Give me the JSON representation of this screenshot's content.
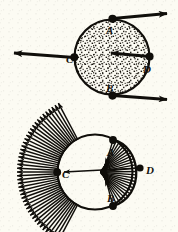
{
  "figure": {
    "background_color": "#fcfbf3",
    "ink_color": "#100e0a",
    "width": 178,
    "height": 232
  },
  "panels": [
    {
      "id": "top",
      "name": "stippled-disk-with-velocity-vectors",
      "shape": "filled-stippled-circle",
      "circle": {
        "cx": 112,
        "cy": 57,
        "r": 38
      },
      "points": [
        {
          "label": "A",
          "x": 112,
          "y": 19,
          "label_x": 109,
          "label_y": 33,
          "marker": "filled-dot"
        },
        {
          "label": "C",
          "x": 74,
          "y": 57,
          "label_x": 69,
          "label_y": 62,
          "marker": "filled-dot"
        },
        {
          "label": "D",
          "x": 150,
          "y": 57,
          "label_x": 145,
          "label_y": 72,
          "marker": "filled-dot"
        },
        {
          "label": "B",
          "x": 112,
          "y": 95,
          "label_x": 109,
          "label_y": 91,
          "marker": "filled-dot"
        }
      ],
      "vectors": [
        {
          "from": "A",
          "x1": 112,
          "y1": 19,
          "x2": 176,
          "y2": 13,
          "direction": "right",
          "name": "velocity-vector-a"
        },
        {
          "from": "C",
          "x1": 74,
          "y1": 57,
          "x2": 4,
          "y2": 52,
          "direction": "left",
          "name": "velocity-vector-c"
        },
        {
          "from": "D",
          "x1": 150,
          "y1": 57,
          "x2": 101,
          "y2": 53,
          "direction": "left",
          "name": "velocity-vector-d"
        },
        {
          "from": "B",
          "x1": 112,
          "y1": 95,
          "x2": 176,
          "y2": 99,
          "direction": "right",
          "name": "velocity-vector-b"
        }
      ]
    },
    {
      "id": "bottom",
      "name": "radial-velocity-field-diagram",
      "shape": "outlined-circle-with-radiating-arrows",
      "circle": {
        "cx": 95,
        "cy": 172,
        "r": 38
      },
      "points": [
        {
          "label": "A",
          "x": 113,
          "y": 140,
          "label_x": 110,
          "label_y": 154,
          "marker": "filled-dot"
        },
        {
          "label": "C",
          "x": 57,
          "y": 172,
          "label_x": 63,
          "label_y": 177,
          "marker": "filled-dot"
        },
        {
          "label": "D",
          "x": 140,
          "y": 168,
          "label_x": 146,
          "label_y": 173,
          "marker": "none"
        },
        {
          "label": "B",
          "x": 113,
          "y": 206,
          "label_x": 109,
          "label_y": 200,
          "marker": "filled-dot"
        }
      ],
      "outward_fan": {
        "name": "outward-arrow-fan",
        "count": 44,
        "start_angle_deg": 118,
        "end_angle_deg": 242,
        "length": 40,
        "description": "arrows with tails on the left arc of the circle pointing radially outward"
      },
      "inward_fan": {
        "name": "inward-arrow-fan",
        "count": 26,
        "start_angle_deg": -56,
        "end_angle_deg": 56,
        "converge_x": 100,
        "converge_y": 172,
        "description": "arrows from the right arc converging to a point just right of C"
      },
      "arc": {
        "name": "right-lobe-arc",
        "description": "bold arc passing through A, D and B bounding the inward fan"
      }
    }
  ],
  "labels": {
    "a": "A",
    "b": "B",
    "c": "C",
    "d": "D"
  }
}
